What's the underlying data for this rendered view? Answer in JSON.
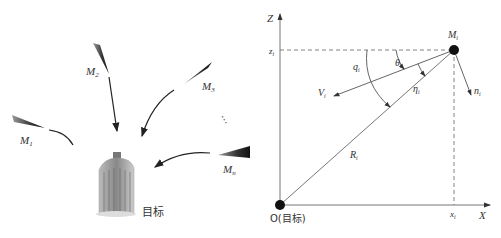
{
  "left_panel": {
    "missiles": [
      {
        "label": "M",
        "sub": "1"
      },
      {
        "label": "M",
        "sub": "2"
      },
      {
        "label": "M",
        "sub": "3"
      },
      {
        "label": "M",
        "sub": "n"
      }
    ],
    "ellipsis": "⋯",
    "target_label": "目标"
  },
  "right_panel": {
    "z_axis": "Z",
    "x_axis": "X",
    "origin_label": "O(目标)",
    "missile_label": {
      "label": "M",
      "sub": "i"
    },
    "zi": {
      "label": "z",
      "sub": "i"
    },
    "xi": {
      "label": "x",
      "sub": "i"
    },
    "q": {
      "label": "q",
      "sub": "i"
    },
    "theta": {
      "label": "θ",
      "sub": "i"
    },
    "eta": {
      "label": "η",
      "sub": "i"
    },
    "V": {
      "label": "V",
      "sub": "i"
    },
    "n": {
      "label": "n",
      "sub": "i"
    },
    "R": {
      "label": "R",
      "sub": "i"
    }
  }
}
